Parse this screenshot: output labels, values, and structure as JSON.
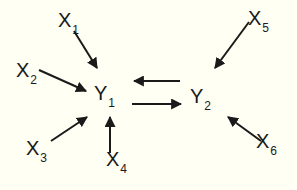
{
  "diagram": {
    "title": "",
    "background": "#fffff4",
    "stroke_color": "#1a1a1a",
    "nodes": [
      {
        "id": "X1",
        "base": "X",
        "sub": "1",
        "x": 58,
        "y": 10
      },
      {
        "id": "X2",
        "base": "X",
        "sub": "2",
        "x": 16,
        "y": 60
      },
      {
        "id": "Y1",
        "base": "Y",
        "sub": "1",
        "x": 94,
        "y": 83
      },
      {
        "id": "X3",
        "base": "X",
        "sub": "3",
        "x": 26,
        "y": 138
      },
      {
        "id": "X4",
        "base": "X",
        "sub": "4",
        "x": 106,
        "y": 149
      },
      {
        "id": "Y2",
        "base": "Y",
        "sub": "2",
        "x": 190,
        "y": 86
      },
      {
        "id": "X5",
        "base": "X",
        "sub": "5",
        "x": 248,
        "y": 8
      },
      {
        "id": "X6",
        "base": "X",
        "sub": "6",
        "x": 256,
        "y": 131
      }
    ],
    "edges": [
      {
        "from": "X1",
        "to": "Y1",
        "x1": 74,
        "y1": 31,
        "x2": 97,
        "y2": 68
      },
      {
        "from": "X2",
        "to": "Y1",
        "x1": 39,
        "y1": 70,
        "x2": 86,
        "y2": 91
      },
      {
        "from": "X3",
        "to": "Y1",
        "x1": 51,
        "y1": 141,
        "x2": 87,
        "y2": 117
      },
      {
        "from": "X4",
        "to": "Y1",
        "x1": 110,
        "y1": 153,
        "x2": 110,
        "y2": 117
      },
      {
        "from": "Y2",
        "to": "Y1",
        "x1": 180,
        "y1": 81,
        "x2": 134,
        "y2": 81
      },
      {
        "from": "Y1",
        "to": "Y2",
        "x1": 132,
        "y1": 104,
        "x2": 181,
        "y2": 104
      },
      {
        "from": "X5",
        "to": "Y2",
        "x1": 249,
        "y1": 22,
        "x2": 215,
        "y2": 68
      },
      {
        "from": "X6",
        "to": "Y2",
        "x1": 261,
        "y1": 141,
        "x2": 228,
        "y2": 117
      }
    ]
  }
}
